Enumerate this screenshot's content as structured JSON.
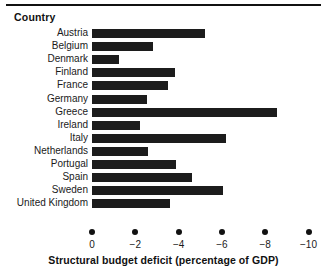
{
  "figure": {
    "axis_heading": "Country",
    "rule_color": "#111111"
  },
  "chart_data": {
    "type": "bar",
    "orientation": "horizontal",
    "title": "",
    "xlabel": "Structural budget deficit (percentage of GDP)",
    "ylabel": "Country",
    "xlim": [
      0,
      -10
    ],
    "xticks": [
      0,
      -2,
      -4,
      -6,
      -8,
      -10
    ],
    "xtick_labels": [
      "0",
      "−2",
      "−4",
      "−6",
      "−8",
      "−10"
    ],
    "grid": false,
    "legend": false,
    "bar_color": "#1c1c1c",
    "categories": [
      "Austria",
      "Belgium",
      "Denmark",
      "Finland",
      "France",
      "Germany",
      "Greece",
      "Ireland",
      "Italy",
      "Netherlands",
      "Portugal",
      "Spain",
      "Sweden",
      "United Kingdom"
    ],
    "values": [
      -5.2,
      -2.8,
      -1.25,
      -3.85,
      -3.5,
      -2.55,
      -8.55,
      -2.2,
      -6.2,
      -2.6,
      -3.9,
      -4.6,
      -6.05,
      -3.6
    ]
  }
}
